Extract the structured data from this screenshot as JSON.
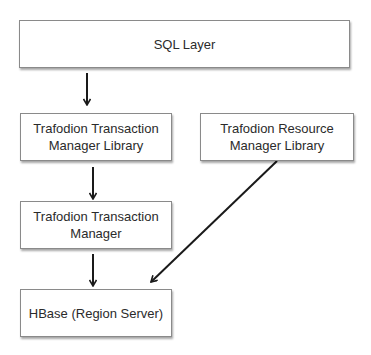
{
  "diagram": {
    "type": "architecture-flow",
    "nodes": [
      {
        "id": "sql",
        "label_lines": [
          "SQL Layer"
        ]
      },
      {
        "id": "tm_lib",
        "label_lines": [
          "Trafodion Transaction",
          "Manager Library"
        ]
      },
      {
        "id": "rm_lib",
        "label_lines": [
          "Trafodion Resource",
          "Manager Library"
        ]
      },
      {
        "id": "tm",
        "label_lines": [
          "Trafodion Transaction",
          "Manager"
        ]
      },
      {
        "id": "hbase",
        "label_lines": [
          "HBase (Region Server)"
        ]
      }
    ],
    "edges": [
      {
        "from": "sql",
        "to": "tm_lib"
      },
      {
        "from": "tm_lib",
        "to": "tm"
      },
      {
        "from": "tm",
        "to": "hbase"
      },
      {
        "from": "rm_lib",
        "to": "hbase"
      }
    ],
    "colors": {
      "box_border": "#8a8a8a",
      "box_fill": "#ffffff",
      "text": "#2b2b2b",
      "arrow": "#1a1a1a"
    }
  }
}
